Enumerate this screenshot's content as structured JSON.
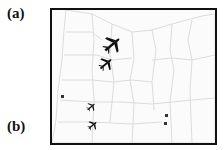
{
  "figure": {
    "panel_labels": {
      "a": "(a)",
      "b": "(b)"
    },
    "map": {
      "region": "Oregon counties",
      "background_color": "#fbfbfb",
      "county_line_color": "#dcdcdc",
      "frame_color": "#111111"
    },
    "planes": [
      {
        "name": "plane-large",
        "x": 113,
        "y": 44,
        "size": 22,
        "rotation": -40
      },
      {
        "name": "plane-medium",
        "x": 106,
        "y": 63,
        "size": 17,
        "rotation": -40
      },
      {
        "name": "plane-small-1",
        "x": 91,
        "y": 102,
        "size": 11,
        "rotation": -40
      },
      {
        "name": "plane-small-2",
        "x": 93,
        "y": 122,
        "size": 12,
        "rotation": -40
      }
    ],
    "markers": [
      {
        "name": "marker-west",
        "x": 62,
        "y": 96
      },
      {
        "name": "marker-east-1",
        "x": 166,
        "y": 115
      },
      {
        "name": "marker-east-2",
        "x": 165,
        "y": 123
      }
    ]
  }
}
